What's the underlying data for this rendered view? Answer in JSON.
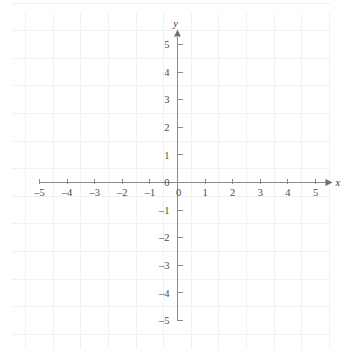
{
  "chart_data": {
    "type": "scatter",
    "title": "",
    "xlabel": "x",
    "ylabel": "y",
    "xlim": [
      -5,
      5
    ],
    "ylim": [
      -5,
      5
    ],
    "grid": true,
    "legend": "none",
    "series": [],
    "x_tick_labels": [
      "–5",
      "–4",
      "–3",
      "–2",
      "–1",
      "0",
      "1",
      "2",
      "3",
      "4",
      "5"
    ],
    "x_tick_values": [
      -5,
      -4,
      -3,
      -2,
      -1,
      0,
      1,
      2,
      3,
      4,
      5
    ],
    "y_tick_labels": [
      "5",
      "4",
      "3",
      "2",
      "1",
      "0",
      "–1",
      "–2",
      "–3",
      "–4",
      "–5"
    ],
    "y_tick_values": [
      5,
      4,
      3,
      2,
      1,
      0,
      -1,
      -2,
      -3,
      -4,
      -5
    ],
    "annotations": []
  },
  "axes": {
    "x_axis_label": "x",
    "y_axis_label": "y",
    "origin_label_x": "0",
    "origin_label_y": "0"
  },
  "x_ticks": [
    {
      "label": "–5",
      "value": -5
    },
    {
      "label": "–4",
      "value": -4
    },
    {
      "label": "–3",
      "value": -3
    },
    {
      "label": "–2",
      "value": -2
    },
    {
      "label": "–1",
      "value": -1
    },
    {
      "label": "1",
      "value": 1
    },
    {
      "label": "2",
      "value": 2
    },
    {
      "label": "3",
      "value": 3
    },
    {
      "label": "4",
      "value": 4
    },
    {
      "label": "5",
      "value": 5
    }
  ],
  "y_ticks": [
    {
      "label": "5",
      "value": 5
    },
    {
      "label": "4",
      "value": 4
    },
    {
      "label": "3",
      "value": 3
    },
    {
      "label": "2",
      "value": 2
    },
    {
      "label": "1",
      "value": 1
    },
    {
      "label": "–1",
      "value": -1
    },
    {
      "label": "–2",
      "value": -2
    },
    {
      "label": "–3",
      "value": -3
    },
    {
      "label": "–4",
      "value": -4
    },
    {
      "label": "–5",
      "value": -5
    }
  ],
  "colors": {
    "grid": "#f1f1f1",
    "axis": "#8a8a8a",
    "text": "#4a4a4a",
    "background": "#ffffff"
  }
}
